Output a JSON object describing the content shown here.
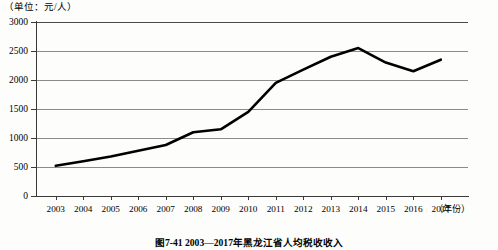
{
  "chart_data": {
    "type": "line",
    "title": "图7-41  2003—2017年黑龙江省人均税收收入",
    "unit_label": "（单位：元/人）",
    "xlabel": "（年份）",
    "ylabel": "",
    "categories": [
      "2003",
      "2004",
      "2005",
      "2006",
      "2007",
      "2008",
      "2009",
      "2010",
      "2011",
      "2012",
      "2013",
      "2014",
      "2015",
      "2016",
      "2017"
    ],
    "values": [
      520,
      600,
      680,
      780,
      880,
      1100,
      1150,
      1450,
      1950,
      2180,
      2400,
      2550,
      2300,
      2150,
      2350
    ],
    "ylim": [
      0,
      3000
    ],
    "yticks": [
      "0",
      "500",
      "1000",
      "1500",
      "2000",
      "2500",
      "3000"
    ],
    "ytick_values": [
      0,
      500,
      1000,
      1500,
      2000,
      2500,
      3000
    ],
    "grid": true,
    "legend": "none",
    "series_color": "#000000",
    "grid_color": "#8b8b8b",
    "axis_color": "#3a3a3a"
  }
}
